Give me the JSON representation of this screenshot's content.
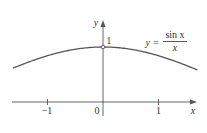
{
  "chart_data": {
    "type": "line",
    "title": "",
    "function": "y = sin x / x",
    "legend": {
      "lhs": "y =",
      "numerator": "sin x",
      "denominator": "x"
    },
    "xlabel": "x",
    "ylabel": "y",
    "xlim": [
      -1.62,
      1.7
    ],
    "ylim": [
      0,
      1.05
    ],
    "x_ticks": [
      {
        "value": -1,
        "label": "−1"
      },
      {
        "value": 0,
        "label": "0"
      },
      {
        "value": 1,
        "label": "1"
      }
    ],
    "y_ticks": [
      {
        "value": 1,
        "label": "1"
      }
    ],
    "hole": {
      "x": 0,
      "y": 1
    },
    "grid": false,
    "series": [
      {
        "name": "sin x / x",
        "x": [
          -1.62,
          -1.5,
          -1.25,
          -1.0,
          -0.75,
          -0.5,
          -0.25,
          0,
          0.25,
          0.5,
          0.75,
          1.0,
          1.25,
          1.5,
          1.68
        ],
        "values": [
          0.617,
          0.665,
          0.759,
          0.841,
          0.909,
          0.959,
          0.99,
          1.0,
          0.99,
          0.959,
          0.909,
          0.841,
          0.759,
          0.665,
          0.592
        ]
      }
    ]
  }
}
